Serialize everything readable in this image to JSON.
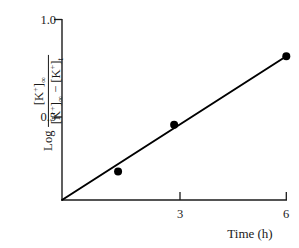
{
  "chart_data": {
    "type": "line",
    "title": "",
    "subtitle": "",
    "xlabel": "Time (h)",
    "ylabel": "Log [K+]∞ / ([K+]∞ − [K+]t)",
    "ylabel_parts": {
      "log_word": "Log",
      "numerator": "[K",
      "numerator_sup": "+",
      "numerator_close": "]",
      "numerator_sub": "∞",
      "denominator_a": "[K",
      "denominator_a_sup": "+",
      "denominator_a_close": "]",
      "denominator_a_sub": "∞",
      "denominator_minus": " − ",
      "denominator_b": "[K",
      "denominator_b_sup": "+",
      "denominator_b_close": "]",
      "denominator_b_sub": "t"
    },
    "x": [
      1.5,
      3,
      6
    ],
    "y": [
      0.17,
      0.45,
      0.86
    ],
    "series": [
      {
        "name": "K+ efflux",
        "x": [
          1.5,
          3,
          6
        ],
        "values": [
          0.17,
          0.45,
          0.86
        ]
      }
    ],
    "fit_line": {
      "from": [
        0,
        0
      ],
      "to": [
        6,
        0.86
      ],
      "slope": 0.1433,
      "intercept": 0
    },
    "xlim": [
      0,
      6
    ],
    "ylim": [
      0,
      1.08
    ],
    "xticks": [
      3,
      6
    ],
    "xtick_labels": [
      "3",
      "6"
    ],
    "yticks": [
      0.5,
      1.0
    ],
    "ytick_labels": [
      "0.5",
      "1.0"
    ],
    "grid": false,
    "legend": false,
    "legend_position": "none",
    "marker": "circle",
    "marker_color": "#000000",
    "line_color": "#000000",
    "axis_color": "#1a1a1a",
    "background": "#ffffff"
  },
  "axes": {
    "y_tick_1": "1.0",
    "y_tick_0_5": "0.5",
    "x_tick_3": "3",
    "x_tick_6": "6",
    "x_title": "Time (h)"
  }
}
